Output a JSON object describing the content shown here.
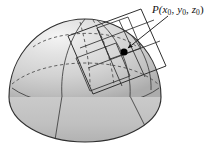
{
  "figure": {
    "background_color": "#ffffff",
    "width": 220,
    "height": 161,
    "annotations": {
      "point_label": {
        "full_text": "P(x0, y0, z0)",
        "prefix": "P(",
        "var_x": "x",
        "sub_x": "0",
        "sep1": ", ",
        "var_y": "y",
        "sub_y": "0",
        "sep2": ", ",
        "var_z": "z",
        "sub_z": "0",
        "suffix": ")"
      }
    },
    "colors": {
      "surface_light": "#e3e3e3",
      "surface_mid": "#cfcfcf",
      "surface_dark": "#b4b4b4",
      "base_fill": "#c2c2c2",
      "outline": "#3a3a3a",
      "dashed": "#4a4a4a",
      "point": "#000000",
      "label_text": "#111111"
    },
    "elements": {
      "dome_name": "hemisphere-dome",
      "base_name": "dome-base-ellipse",
      "tangent_plane_name": "tangent-plane-parallelogram",
      "point_name": "point-p-marker",
      "leader_name": "leader-line-with-arrow",
      "meridians_name": "meridian-curves",
      "latitude_name": "latitude-curves"
    }
  }
}
